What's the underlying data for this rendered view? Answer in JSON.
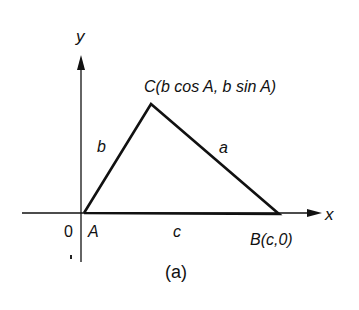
{
  "axes": {
    "x_label": "x",
    "y_label": "y",
    "origin_label": "0"
  },
  "vertices": {
    "A": "A",
    "B": "B(c,0)",
    "C": "C(b cos A, b sin A)"
  },
  "sides": {
    "a": "a",
    "b": "b",
    "c": "c"
  },
  "caption": "(a)"
}
